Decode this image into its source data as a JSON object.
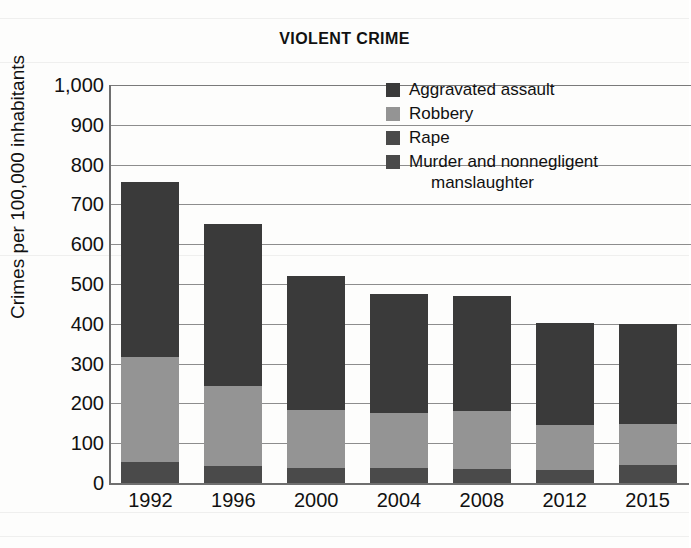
{
  "chart_data": {
    "type": "bar",
    "subtype": "stacked",
    "title": "VIOLENT CRIME",
    "xlabel": "",
    "ylabel": "Crimes per 100,000 inhabitants",
    "ylim": [
      0,
      1000
    ],
    "ytick_step": 100,
    "yticks": [
      "1,000",
      "900",
      "800",
      "700",
      "600",
      "500",
      "400",
      "300",
      "200",
      "100",
      "0"
    ],
    "ytick_values": [
      1000,
      900,
      800,
      700,
      600,
      500,
      400,
      300,
      200,
      100,
      0
    ],
    "categories": [
      "1992",
      "1996",
      "2000",
      "2004",
      "2008",
      "2012",
      "2015"
    ],
    "grid": true,
    "grid_axis": "y",
    "legend_position": "top-right",
    "totals": [
      757,
      651,
      519,
      475,
      471,
      402,
      399
    ],
    "series": [
      {
        "name": "Murder and nonnegligent manslaughter",
        "color": "#4a4a4a",
        "values": [
          9,
          7,
          6,
          6,
          5,
          5,
          5
        ]
      },
      {
        "name": "Rape",
        "color": "#4a4a4a",
        "values": [
          43,
          36,
          32,
          32,
          30,
          27,
          40
        ]
      },
      {
        "name": "Robbery",
        "color": "#949494",
        "values": [
          264,
          202,
          145,
          137,
          146,
          113,
          103
        ]
      },
      {
        "name": "Aggravated assault",
        "color": "#3a3a3a",
        "values": [
          441,
          406,
          336,
          300,
          290,
          257,
          251
        ]
      }
    ]
  },
  "legend": {
    "items": [
      {
        "label": "Aggravated assault",
        "label2": "",
        "color": "#3a3a3a"
      },
      {
        "label": "Robbery",
        "label2": "",
        "color": "#949494"
      },
      {
        "label": "Rape",
        "label2": "",
        "color": "#4a4a4a"
      },
      {
        "label": "Murder and nonnegligent",
        "label2": "manslaughter",
        "color": "#4a4a4a"
      }
    ]
  }
}
